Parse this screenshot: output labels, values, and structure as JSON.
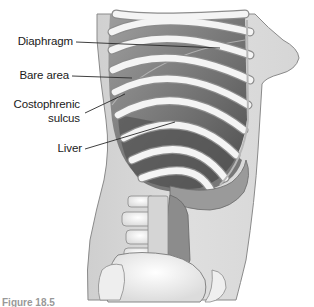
{
  "figure": {
    "type": "anatomical-illustration",
    "labels": [
      {
        "id": "diaphragm",
        "text": "Diaphragm"
      },
      {
        "id": "bare-area",
        "text": "Bare area"
      },
      {
        "id": "costophrenic-sulcus-line1",
        "text": "Costophrenic"
      },
      {
        "id": "costophrenic-sulcus-line2",
        "text": "sulcus"
      },
      {
        "id": "liver",
        "text": "Liver"
      }
    ],
    "caption": "Figure 18.5",
    "colors": {
      "background": "#ffffff",
      "skin": "#d9d9d9",
      "body_outline": "#8a8a8a",
      "rib": "#f2f2f2",
      "rib_shadow": "#9a9a9a",
      "intercostal": "#6e6e6e",
      "liver_dark": "#4a4a4a",
      "bone": "#f4f4f4",
      "colon": "#8c8c8c",
      "label_text": "#1a1a1a",
      "leader_line": "#2a2a2a"
    }
  }
}
